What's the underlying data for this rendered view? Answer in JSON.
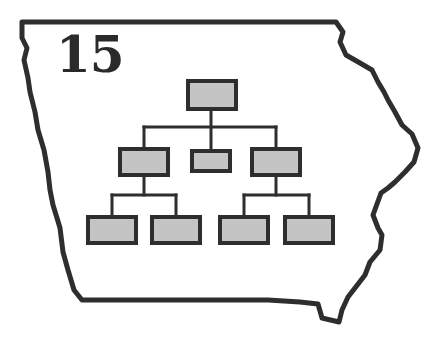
{
  "figure": {
    "number_label": "15"
  },
  "colors": {
    "outline": "#2e2e2e",
    "box_fill": "#c4c4c4",
    "box_stroke": "#2e2e2e",
    "connector": "#2e2e2e",
    "background": "#ffffff"
  },
  "state_outline": {
    "name": "Iowa",
    "points": "22,22 336,22 343,32 340,42 346,55 360,63 372,70 378,82 384,92 388,100 395,112 402,125 412,134 418,148 414,162 405,172 395,182 388,188 381,193 373,215 378,228 382,235 380,250 370,262 365,275 355,288 348,297 342,310 339,322 322,318 318,304 300,302 268,300 82,300 74,290 68,270 63,252 60,228 57,218 53,205 50,190 48,172 44,150 38,130 35,112 30,92 28,78 24,60 27,48 22,38"
  },
  "org_chart": {
    "nodes": [
      {
        "id": "root",
        "level": 0,
        "x": 188,
        "y": 81,
        "w": 48,
        "h": 28
      },
      {
        "id": "l1-left",
        "level": 1,
        "x": 120,
        "y": 149,
        "w": 48,
        "h": 26
      },
      {
        "id": "l1-center",
        "level": 1,
        "x": 192,
        "y": 151,
        "w": 38,
        "h": 20
      },
      {
        "id": "l1-right",
        "level": 1,
        "x": 252,
        "y": 149,
        "w": 48,
        "h": 26
      },
      {
        "id": "l2-1",
        "level": 2,
        "x": 88,
        "y": 217,
        "w": 48,
        "h": 26
      },
      {
        "id": "l2-2",
        "level": 2,
        "x": 152,
        "y": 217,
        "w": 48,
        "h": 26
      },
      {
        "id": "l2-3",
        "level": 2,
        "x": 220,
        "y": 217,
        "w": 48,
        "h": 26
      },
      {
        "id": "l2-4",
        "level": 2,
        "x": 285,
        "y": 217,
        "w": 48,
        "h": 26
      }
    ],
    "connectors": [
      {
        "from": "root",
        "path": "M211,109 L211,150"
      },
      {
        "from": "root-bus",
        "path": "M144,127 L276,127"
      },
      {
        "from": "bus-left",
        "path": "M144,127 L144,149"
      },
      {
        "from": "bus-right",
        "path": "M276,127 L276,149"
      },
      {
        "from": "l1-left",
        "path": "M144,175 L144,195"
      },
      {
        "from": "l1-left-bus",
        "path": "M112,195 L176,195"
      },
      {
        "from": "bus-l2-1",
        "path": "M112,195 L112,217"
      },
      {
        "from": "bus-l2-2",
        "path": "M176,195 L176,217"
      },
      {
        "from": "l1-right",
        "path": "M276,175 L276,195"
      },
      {
        "from": "l1-right-bus",
        "path": "M244,195 L309,195"
      },
      {
        "from": "bus-l2-3",
        "path": "M244,195 L244,217"
      },
      {
        "from": "bus-l2-4",
        "path": "M309,195 L309,217"
      }
    ]
  }
}
